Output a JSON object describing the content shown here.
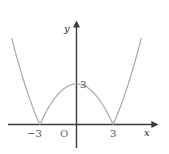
{
  "figure": {
    "type": "math-graph",
    "background_color": "#ffffff",
    "curve_color": "#a8a8a8",
    "axis_color": "#3a3a3a",
    "text_color": "#2b2b2b"
  },
  "axes": {
    "x_axis_label": "x",
    "y_axis_label": "y",
    "origin_label": "O",
    "x_ticks": [
      {
        "label": "−3",
        "value": -3
      },
      {
        "label": "3",
        "value": 3
      }
    ],
    "y_ticks": [
      {
        "label": "3",
        "value": 3
      }
    ]
  },
  "chart_data": {
    "type": "line",
    "title": "",
    "xlabel": "x",
    "ylabel": "y",
    "grid": false,
    "legend": null,
    "xlim": [
      -5.5,
      5.5
    ],
    "ylim": [
      -1.2,
      8.5
    ],
    "annotations": [
      {
        "text": "−3",
        "x": -3,
        "y": 0,
        "kind": "x-tick"
      },
      {
        "text": "3",
        "x": 3,
        "y": 0,
        "kind": "x-tick"
      },
      {
        "text": "3",
        "x": 0,
        "y": 3,
        "kind": "y-tick"
      },
      {
        "text": "O",
        "x": 0,
        "y": 0,
        "kind": "origin"
      }
    ],
    "series": [
      {
        "name": "y = |x² − 9| / 3",
        "color": "#a8a8a8",
        "x": [
          -5.3,
          -5.0,
          -4.6,
          -4.2,
          -3.8,
          -3.4,
          -3.0,
          -2.6,
          -2.2,
          -1.8,
          -1.4,
          -1.0,
          -0.6,
          -0.2,
          0.0,
          0.2,
          0.6,
          1.0,
          1.4,
          1.8,
          2.2,
          2.6,
          3.0,
          3.4,
          3.8,
          4.2,
          4.6,
          5.0,
          5.3
        ],
        "values": [
          6.37,
          5.33,
          4.05,
          2.88,
          1.81,
          0.85,
          0.0,
          0.75,
          1.39,
          1.92,
          2.35,
          2.67,
          2.88,
          2.99,
          3.0,
          2.99,
          2.88,
          2.67,
          2.35,
          1.92,
          1.39,
          0.75,
          0.0,
          0.85,
          1.81,
          2.88,
          4.05,
          5.33,
          6.37
        ]
      }
    ]
  }
}
